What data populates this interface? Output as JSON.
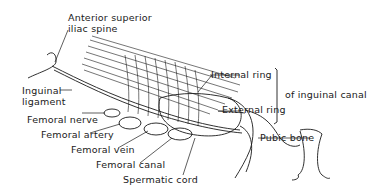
{
  "diagram": {
    "labels": {
      "asis_line1": "Anterior superior",
      "asis_line2": "iliac spine",
      "inguinal_lig_line1": "Inguinal",
      "inguinal_lig_line2": "ligament",
      "femoral_nerve": "Femoral nerve",
      "femoral_artery": "Femoral artery",
      "femoral_vein": "Femoral vein",
      "femoral_canal": "Femoral canal",
      "spermatic_cord": "Spermatic cord",
      "internal_ring": "Internal ring",
      "external_ring": "External ring",
      "of_inguinal_canal": "of inguinal canal",
      "pubic_bone": "Pubic bone"
    },
    "colors": {
      "line": "#1a1a1a",
      "background": "#ffffff"
    }
  }
}
